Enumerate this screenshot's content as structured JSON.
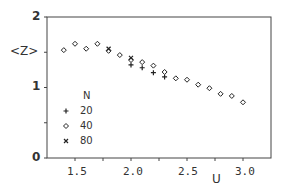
{
  "chart_data": {
    "type": "scatter",
    "title": "",
    "xlabel": "U",
    "ylabel": "<Z>",
    "xlim": [
      1.25,
      3.25
    ],
    "ylim": [
      0,
      2
    ],
    "x_ticks": [
      "1.5",
      "2.0",
      "2.5",
      "3.0"
    ],
    "x_minor_ticks": [
      1.75,
      2.25,
      2.75
    ],
    "y_ticks": [
      "0",
      "1",
      "2"
    ],
    "y_minor_ticks": [
      0.5,
      1.5
    ],
    "grid": false,
    "legend": {
      "title": "N",
      "position": "lower-left inside"
    },
    "series": [
      {
        "name": "20",
        "marker": "+",
        "x": [
          2.0,
          2.1,
          2.2,
          2.3
        ],
        "y": [
          1.32,
          1.28,
          1.21,
          1.15
        ]
      },
      {
        "name": "40",
        "marker": "diamond",
        "x": [
          1.4,
          1.5,
          1.6,
          1.7,
          1.8,
          1.9,
          2.0,
          2.1,
          2.2,
          2.3,
          2.4,
          2.5,
          2.6,
          2.7,
          2.8,
          2.9,
          3.0
        ],
        "y": [
          1.53,
          1.62,
          1.55,
          1.62,
          1.52,
          1.46,
          1.39,
          1.36,
          1.31,
          1.22,
          1.13,
          1.11,
          1.04,
          0.99,
          0.91,
          0.88,
          0.79
        ]
      },
      {
        "name": "80",
        "marker": "x",
        "x": [
          1.8,
          2.0
        ],
        "y": [
          1.55,
          1.42
        ]
      }
    ]
  },
  "labels": {
    "ylabel": "<Z>",
    "xlabel": "U",
    "legend_title": "N",
    "y_ticks": [
      "2",
      "1",
      "0"
    ],
    "x_ticks": [
      "1.5",
      "2.0",
      "2.5",
      "3.0"
    ],
    "legend_items": [
      "20",
      "40",
      "80"
    ]
  }
}
